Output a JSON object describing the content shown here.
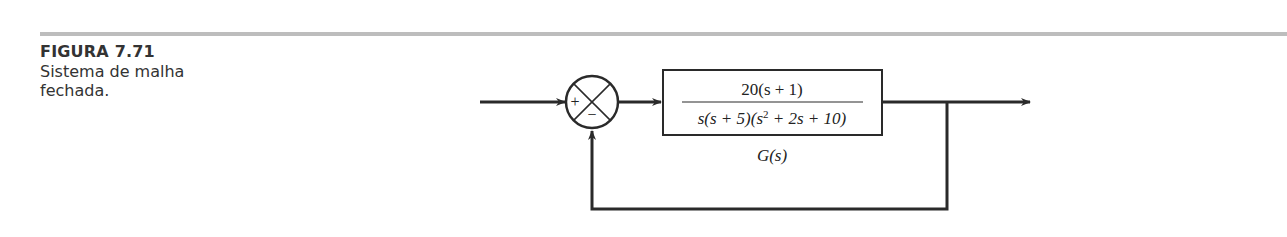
{
  "figure": {
    "label": "FIGURA 7.71",
    "caption_line1": "Sistema de malha",
    "caption_line2": "fechada."
  },
  "diagram": {
    "type": "block-diagram",
    "summing_junction": {
      "plus_sign": "+",
      "minus_sign": "−"
    },
    "block": {
      "numerator": "20(s + 1)",
      "denominator_parts": [
        "s(s + 5)(s",
        "2",
        " + 2s + 10)"
      ],
      "label": "G(s)"
    },
    "feedback": "unity negative feedback",
    "colors": {
      "line": "#2a2a2a",
      "rule": "#bdbdbd",
      "text": "#333333"
    }
  }
}
